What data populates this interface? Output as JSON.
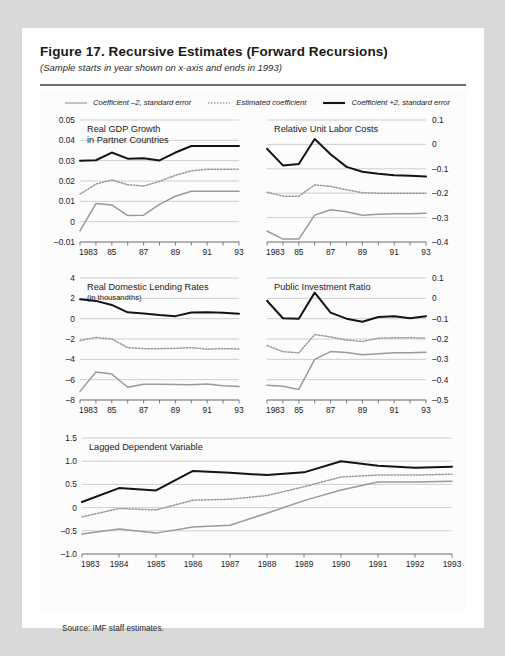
{
  "figure": {
    "title": "Figure 17.  Recursive Estimates (Forward Recursions)",
    "subtitle": "(Sample starts in year shown on x-axis and ends in 1993)",
    "source": "Source:  IMF staff estimates."
  },
  "legend": {
    "items": [
      {
        "label": "Coefficient –2, standard error",
        "style": "thin-solid",
        "color": "#9a9a9a"
      },
      {
        "label": "Estimated coefficient",
        "style": "dotted",
        "color": "#9a9a9a"
      },
      {
        "label": "Coefficient +2, standard error",
        "style": "thick-solid",
        "color": "#141414"
      }
    ]
  },
  "colors": {
    "lower_band": "#9a9a9a",
    "estimate": "#9a9a9a",
    "upper_band": "#141414",
    "gridline": "#c9c9c9",
    "axis": "#6f6f6f",
    "card": "#ffffff",
    "page": "#d9d9d9"
  },
  "chart_data": [
    {
      "type": "line",
      "title": "Real GDP Growth\nin Partner Countries",
      "title_lines": [
        "Real GDP Growth",
        "in Partner Countries"
      ],
      "subtitle": "",
      "xlabel": "",
      "ylabel": "",
      "axis_side": "left",
      "x": [
        1983,
        1984,
        1985,
        1986,
        1987,
        1988,
        1989,
        1990,
        1991,
        1992,
        1993
      ],
      "xtick_labels": [
        "1983",
        "",
        "85",
        "",
        "87",
        "",
        "89",
        "",
        "91",
        "",
        "93"
      ],
      "ylim": [
        -0.01,
        0.05
      ],
      "yticks": [
        -0.01,
        0,
        0.01,
        0.02,
        0.03,
        0.04,
        0.05
      ],
      "ytick_labels": [
        "–0.01",
        "0",
        "0.01",
        "0.02",
        "0.03",
        "0.04",
        "0.05"
      ],
      "grid": true,
      "series": [
        {
          "name": "Coefficient +2, standard error",
          "style": "thick-solid",
          "color": "#141414",
          "values": [
            0.03,
            0.0302,
            0.034,
            0.031,
            0.0312,
            0.0301,
            0.034,
            0.0372,
            0.0372,
            0.0372,
            0.0372
          ]
        },
        {
          "name": "Estimated coefficient",
          "style": "dotted",
          "color": "#9a9a9a",
          "values": [
            0.0135,
            0.0185,
            0.0205,
            0.0182,
            0.0175,
            0.0198,
            0.0228,
            0.025,
            0.0258,
            0.0258,
            0.0258
          ]
        },
        {
          "name": "Coefficient –2, standard error",
          "style": "thin-solid",
          "color": "#9a9a9a",
          "values": [
            -0.0045,
            0.0089,
            0.0082,
            0.003,
            0.0032,
            0.0085,
            0.0125,
            0.015,
            0.015,
            0.015,
            0.015
          ]
        }
      ]
    },
    {
      "type": "line",
      "title": "Relative Unit Labor Costs",
      "title_lines": [
        "Relative Unit Labor Costs"
      ],
      "subtitle": "",
      "xlabel": "",
      "ylabel": "",
      "axis_side": "right",
      "x": [
        1983,
        1984,
        1985,
        1986,
        1987,
        1988,
        1989,
        1990,
        1991,
        1992,
        1993
      ],
      "xtick_labels": [
        "1983",
        "",
        "85",
        "",
        "87",
        "",
        "89",
        "",
        "91",
        "",
        "93"
      ],
      "ylim": [
        -0.4,
        0.1
      ],
      "yticks": [
        -0.4,
        -0.3,
        -0.2,
        -0.1,
        0,
        0.1
      ],
      "ytick_labels": [
        "–0.4",
        "–0.3",
        "–0.2",
        "–0.1",
        "0",
        "0.1"
      ],
      "grid": true,
      "series": [
        {
          "name": "Coefficient +2, standard error",
          "style": "thick-solid",
          "color": "#141414",
          "values": [
            -0.018,
            -0.086,
            -0.08,
            0.022,
            -0.04,
            -0.092,
            -0.112,
            -0.12,
            -0.126,
            -0.128,
            -0.132
          ]
        },
        {
          "name": "Estimated coefficient",
          "style": "dotted",
          "color": "#9a9a9a",
          "values": [
            -0.196,
            -0.212,
            -0.212,
            -0.166,
            -0.172,
            -0.186,
            -0.198,
            -0.2,
            -0.2,
            -0.2,
            -0.2
          ]
        },
        {
          "name": "Coefficient –2, standard error",
          "style": "thin-solid",
          "color": "#9a9a9a",
          "values": [
            -0.355,
            -0.388,
            -0.388,
            -0.29,
            -0.268,
            -0.276,
            -0.29,
            -0.286,
            -0.284,
            -0.284,
            -0.282
          ]
        }
      ]
    },
    {
      "type": "line",
      "title": "Real Domestic Lending Rates",
      "title_lines": [
        "Real Domestic Lending Rates"
      ],
      "subtitle": "(in thousandths)",
      "xlabel": "",
      "ylabel": "",
      "axis_side": "left",
      "x": [
        1983,
        1984,
        1985,
        1986,
        1987,
        1988,
        1989,
        1990,
        1991,
        1992,
        1993
      ],
      "xtick_labels": [
        "1983",
        "",
        "85",
        "",
        "87",
        "",
        "89",
        "",
        "91",
        "",
        "93"
      ],
      "ylim": [
        -8,
        4
      ],
      "yticks": [
        -8,
        -6,
        -4,
        -2,
        0,
        2,
        4
      ],
      "ytick_labels": [
        "–8",
        "–6",
        "–4",
        "–2",
        "0",
        "2",
        "4"
      ],
      "grid": true,
      "series": [
        {
          "name": "Coefficient +2, standard error",
          "style": "thick-solid",
          "color": "#141414",
          "values": [
            1.9,
            1.75,
            1.35,
            0.62,
            0.5,
            0.35,
            0.25,
            0.6,
            0.62,
            0.58,
            0.48
          ]
        },
        {
          "name": "Estimated coefficient",
          "style": "dotted",
          "color": "#9a9a9a",
          "values": [
            -2.15,
            -1.85,
            -2.0,
            -2.85,
            -2.95,
            -2.95,
            -2.92,
            -2.85,
            -3.0,
            -2.95,
            -2.98
          ]
        },
        {
          "name": "Coefficient –2, standard error",
          "style": "thin-solid",
          "color": "#9a9a9a",
          "values": [
            -7.15,
            -5.25,
            -5.45,
            -6.75,
            -6.45,
            -6.45,
            -6.48,
            -6.5,
            -6.42,
            -6.6,
            -6.68
          ]
        }
      ]
    },
    {
      "type": "line",
      "title": "Public Investment Ratio",
      "title_lines": [
        "Public Investment Ratio"
      ],
      "subtitle": "",
      "xlabel": "",
      "ylabel": "",
      "axis_side": "right",
      "x": [
        1983,
        1984,
        1985,
        1986,
        1987,
        1988,
        1989,
        1990,
        1991,
        1992,
        1993
      ],
      "xtick_labels": [
        "1983",
        "",
        "85",
        "",
        "87",
        "",
        "89",
        "",
        "91",
        "",
        "93"
      ],
      "ylim": [
        -0.5,
        0.1
      ],
      "yticks": [
        -0.5,
        -0.4,
        -0.3,
        -0.2,
        -0.1,
        0,
        0.1
      ],
      "ytick_labels": [
        "–0.5",
        "–0.4",
        "–0.3",
        "–0.2",
        "–0.1",
        "0",
        "0.1"
      ],
      "grid": true,
      "series": [
        {
          "name": "Coefficient +2, standard error",
          "style": "thick-solid",
          "color": "#141414",
          "values": [
            -0.012,
            -0.098,
            -0.1,
            0.028,
            -0.07,
            -0.1,
            -0.115,
            -0.092,
            -0.088,
            -0.098,
            -0.088
          ]
        },
        {
          "name": "Estimated coefficient",
          "style": "dotted",
          "color": "#9a9a9a",
          "values": [
            -0.232,
            -0.262,
            -0.268,
            -0.178,
            -0.19,
            -0.205,
            -0.212,
            -0.196,
            -0.194,
            -0.194,
            -0.196
          ]
        },
        {
          "name": "Coefficient –2, standard error",
          "style": "thin-solid",
          "color": "#9a9a9a",
          "values": [
            -0.428,
            -0.432,
            -0.448,
            -0.3,
            -0.262,
            -0.266,
            -0.278,
            -0.272,
            -0.268,
            -0.268,
            -0.265
          ]
        }
      ]
    },
    {
      "type": "line",
      "title": "Lagged Dependent Variable",
      "title_lines": [
        "Lagged Dependent Variable"
      ],
      "subtitle": "",
      "xlabel": "",
      "ylabel": "",
      "axis_side": "left",
      "x": [
        1983,
        1984,
        1985,
        1986,
        1987,
        1988,
        1989,
        1990,
        1991,
        1992,
        1993
      ],
      "xtick_labels": [
        "1983",
        "1984",
        "1985",
        "1986",
        "1987",
        "1988",
        "1989",
        "1990",
        "1991",
        "1992",
        "1993"
      ],
      "ylim": [
        -1.0,
        1.5
      ],
      "yticks": [
        -1.0,
        -0.5,
        0,
        0.5,
        1.0,
        1.5
      ],
      "ytick_labels": [
        "–1.0",
        "–0.5",
        "0",
        "0.5",
        "1.0",
        "1.5"
      ],
      "grid": true,
      "series": [
        {
          "name": "Coefficient +2, standard error",
          "style": "thick-solid",
          "color": "#141414",
          "values": [
            0.12,
            0.42,
            0.37,
            0.79,
            0.75,
            0.7,
            0.76,
            1.0,
            0.9,
            0.86,
            0.88
          ]
        },
        {
          "name": "Estimated coefficient",
          "style": "dotted",
          "color": "#9a9a9a",
          "values": [
            -0.2,
            -0.02,
            -0.05,
            0.16,
            0.18,
            0.26,
            0.45,
            0.66,
            0.7,
            0.7,
            0.72
          ]
        },
        {
          "name": "Coefficient –2, standard error",
          "style": "thin-solid",
          "color": "#9a9a9a",
          "values": [
            -0.57,
            -0.46,
            -0.55,
            -0.42,
            -0.38,
            -0.12,
            0.15,
            0.38,
            0.55,
            0.55,
            0.57
          ]
        }
      ]
    }
  ]
}
